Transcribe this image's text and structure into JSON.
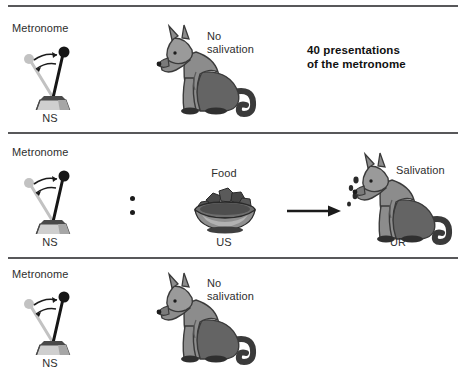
{
  "figure": {
    "title_text": "Classical conditioning: metronome (NS) paired with food (US)",
    "width": 464,
    "height": 384,
    "background": "#ffffff",
    "divider_color": "#58585a"
  },
  "palette": {
    "dog_body": "#8c8c8c",
    "dog_shadow": "#646464",
    "dog_dark": "#5a5a5a",
    "dog_outline": "#3a3a3a",
    "metronome_base": "#c9c9c9",
    "metronome_base_dark": "#9a9a9a",
    "metronome_rod": "#161616",
    "metronome_ghost": "#bdbdbd",
    "bowl_body": "#8f8f8f",
    "bowl_dark": "#4d4d4d",
    "food_dark": "#3f3f3f",
    "text": "#2e2e2e",
    "text_bold": "#111111"
  },
  "rows": [
    {
      "id": "row-before-conditioning",
      "metronome_label": "Metronome",
      "ns_label": "NS",
      "dog_label": "No\nsalivation",
      "note": "40 presentations\nof the metronome",
      "has_food": false,
      "has_arrow": false,
      "has_dots": false,
      "dog_salivating": false
    },
    {
      "id": "row-conditioning-trial",
      "metronome_label": "Metronome",
      "ns_label": "NS",
      "food_label": "Food",
      "us_label": "US",
      "ur_label": "UR",
      "dog_label": "Salivation",
      "has_food": true,
      "has_arrow": true,
      "has_dots": true,
      "dog_salivating": true
    },
    {
      "id": "row-test-trial",
      "metronome_label": "Metronome",
      "ns_label": "NS",
      "dog_label": "No\nsalivation",
      "has_food": false,
      "has_arrow": false,
      "has_dots": false,
      "dog_salivating": false
    }
  ]
}
